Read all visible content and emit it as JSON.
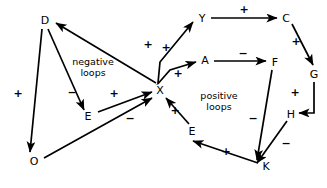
{
  "diagram": {
    "line_color": "#000000",
    "background_color": "#ffffff",
    "nodes": [
      {
        "id": "D",
        "label": "D",
        "x": 45,
        "y": 20
      },
      {
        "id": "E1",
        "label": "E",
        "x": 88,
        "y": 116
      },
      {
        "id": "O",
        "label": "O",
        "x": 34,
        "y": 161
      },
      {
        "id": "X",
        "label": "X",
        "x": 160,
        "y": 90
      },
      {
        "id": "Y",
        "label": "Y",
        "x": 202,
        "y": 18
      },
      {
        "id": "A",
        "label": "A",
        "x": 205,
        "y": 60
      },
      {
        "id": "C",
        "label": "C",
        "x": 286,
        "y": 18
      },
      {
        "id": "F",
        "label": "F",
        "x": 275,
        "y": 62
      },
      {
        "id": "G",
        "label": "G",
        "x": 314,
        "y": 74
      },
      {
        "id": "H",
        "label": "H",
        "x": 291,
        "y": 114
      },
      {
        "id": "E2",
        "label": "E",
        "x": 192,
        "y": 131
      },
      {
        "id": "K",
        "label": "K",
        "x": 266,
        "y": 166
      }
    ],
    "edges": [
      {
        "from": "X",
        "to": "D",
        "sign": "+",
        "sign_x": 148,
        "sign_y": 44
      },
      {
        "from": "D",
        "to": "O",
        "sign": "+",
        "sign_x": 18,
        "sign_y": 93
      },
      {
        "from": "D",
        "to": "E1",
        "sign": "−",
        "sign_x": 72,
        "sign_y": 92
      },
      {
        "from": "E1",
        "to": "X",
        "sign": "+",
        "sign_x": 114,
        "sign_y": 93
      },
      {
        "from": "O",
        "to": "X",
        "sign": "−",
        "sign_x": 130,
        "sign_y": 118
      },
      {
        "from": "X",
        "to": "Y",
        "sign": "+",
        "sign_x": 166,
        "sign_y": 47
      },
      {
        "from": "X",
        "to": "A",
        "sign": "+",
        "sign_x": 178,
        "sign_y": 73
      },
      {
        "from": "Y",
        "to": "C",
        "sign": "+",
        "sign_x": 244,
        "sign_y": 9
      },
      {
        "from": "A",
        "to": "F",
        "sign": "−",
        "sign_x": 243,
        "sign_y": 53
      },
      {
        "from": "C",
        "to": "G",
        "sign": "+",
        "sign_x": 296,
        "sign_y": 41
      },
      {
        "from": "G",
        "to": "H",
        "sign": "+",
        "sign_x": 295,
        "sign_y": 92
      },
      {
        "from": "F",
        "to": "K",
        "sign": "−",
        "sign_x": 253,
        "sign_y": 118
      },
      {
        "from": "H",
        "to": "K",
        "sign": "−",
        "sign_x": 286,
        "sign_y": 143
      },
      {
        "from": "K",
        "to": "E2",
        "sign": "+",
        "sign_x": 226,
        "sign_y": 151
      },
      {
        "from": "E2",
        "to": "X",
        "sign": "+",
        "sign_x": 175,
        "sign_y": 110
      }
    ],
    "annotations": [
      {
        "id": "negative-loops",
        "line1": "negative",
        "line2": "loops",
        "x": 93,
        "y": 67
      },
      {
        "id": "positive-loops",
        "line1": "positive",
        "line2": "loops",
        "x": 219,
        "y": 101
      }
    ]
  }
}
